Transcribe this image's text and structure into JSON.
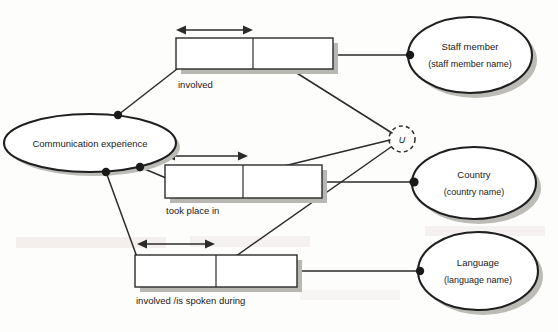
{
  "diagram": {
    "type": "object-role-model",
    "canvas": {
      "width": 558,
      "height": 332,
      "background": "#fdfdfc"
    },
    "colors": {
      "stroke": "#2b2b2b",
      "entity_stroke": "#1f1f1f",
      "shadow": "#bdbbb6",
      "fill": "#ffffff",
      "text": "#1a1a1a"
    },
    "object_types": [
      {
        "id": "communication-experience",
        "name": "Communication experience",
        "reference": "",
        "cx": 90,
        "cy": 143,
        "rx": 86,
        "ry": 29
      },
      {
        "id": "staff-member",
        "name": "Staff member",
        "reference": "(staff member name)",
        "cx": 470,
        "cy": 55,
        "rx": 62,
        "ry": 38
      },
      {
        "id": "country",
        "name": "Country",
        "reference": "(country name)",
        "cx": 474,
        "cy": 183,
        "rx": 62,
        "ry": 36
      },
      {
        "id": "language",
        "name": "Language",
        "reference": "(language name)",
        "cx": 478,
        "cy": 271,
        "rx": 60,
        "ry": 39
      }
    ],
    "fact_types": [
      {
        "id": "involved-staff",
        "label": "involved",
        "label_x": 178,
        "label_y": 93,
        "x": 176,
        "y": 38,
        "width": 157,
        "height": 31,
        "divider_x": 253,
        "uniqueness": {
          "x1": 177,
          "x2": 252,
          "y": 30
        }
      },
      {
        "id": "took-place-in",
        "label": "took place in",
        "label_x": 166,
        "label_y": 213,
        "x": 165,
        "y": 165,
        "width": 157,
        "height": 33,
        "divider_x": 243,
        "uniqueness": {
          "x1": 166,
          "x2": 247,
          "y": 156
        }
      },
      {
        "id": "involved-is-spoken-during",
        "label": "involved   /is spoken during",
        "label_x": 136,
        "label_y": 303,
        "x": 135,
        "y": 255,
        "width": 162,
        "height": 32,
        "divider_x": 216,
        "uniqueness": {
          "x1": 138,
          "x2": 213,
          "y": 244
        }
      }
    ],
    "constraints": [
      {
        "id": "external-uniqueness",
        "letter": "U",
        "cx": 402,
        "cy": 139,
        "r": 13
      }
    ],
    "role_connectors": [
      {
        "id": "ce-to-involved-staff",
        "from": "communication-experience",
        "to": "involved-staff"
      },
      {
        "id": "ce-to-took-place-in",
        "from": "communication-experience",
        "to": "took-place-in"
      },
      {
        "id": "ce-to-involved-language",
        "from": "communication-experience",
        "to": "involved-is-spoken-during"
      },
      {
        "id": "involved-staff-to-staff-member",
        "from": "involved-staff",
        "to": "staff-member"
      },
      {
        "id": "took-place-in-to-country",
        "from": "took-place-in",
        "to": "country"
      },
      {
        "id": "involved-language-to-language",
        "from": "involved-is-spoken-during",
        "to": "language"
      }
    ],
    "constraint_connectors": [
      {
        "id": "u-to-involved-staff",
        "from": "external-uniqueness",
        "to": "involved-staff"
      },
      {
        "id": "u-to-took-place-in",
        "from": "external-uniqueness",
        "to": "took-place-in"
      },
      {
        "id": "u-to-involved-language",
        "from": "external-uniqueness",
        "to": "involved-is-spoken-during"
      }
    ],
    "background_artifacts": [
      {
        "id": "scan-bleed-top",
        "text": "",
        "x": 0,
        "y": 0
      },
      {
        "id": "scan-bleed-mid",
        "text": "",
        "x": 0,
        "y": 0
      }
    ]
  }
}
